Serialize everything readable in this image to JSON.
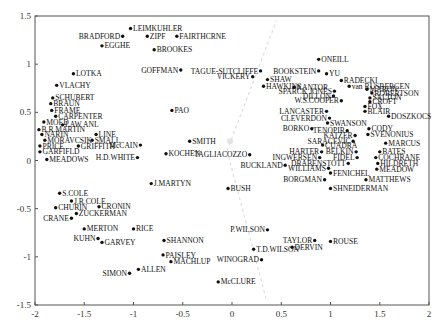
{
  "chart_data": {
    "type": "scatter",
    "title": "",
    "xlabel": "",
    "ylabel": "",
    "xlim": [
      -2,
      2
    ],
    "ylim": [
      -1.5,
      1.5
    ],
    "xticks": [
      -2,
      -1.5,
      -1,
      -0.5,
      0,
      0.5,
      1,
      1.5,
      2
    ],
    "yticks": [
      -1.5,
      -1,
      -0.5,
      0,
      0.5,
      1,
      1.5
    ],
    "grid": false,
    "legend": null,
    "colors": {
      "point": "#111111",
      "axis": "#555555",
      "guide": "#dddddd"
    },
    "points": [
      {
        "label": "LEIMKUHLER",
        "x": -1.03,
        "y": 1.37,
        "side": "right"
      },
      {
        "label": "BRADFORD",
        "x": -1.11,
        "y": 1.29,
        "side": "left"
      },
      {
        "label": "ZIPF",
        "x": -0.86,
        "y": 1.29,
        "side": "right"
      },
      {
        "label": "FAIRTHCRNE",
        "x": -0.56,
        "y": 1.29,
        "side": "right"
      },
      {
        "label": "EGGHE",
        "x": -1.32,
        "y": 1.19,
        "side": "right"
      },
      {
        "label": "BROOKES",
        "x": -0.79,
        "y": 1.15,
        "side": "right"
      },
      {
        "label": "LOTKA",
        "x": -1.61,
        "y": 0.9,
        "side": "right"
      },
      {
        "label": "GOFFMAN",
        "x": -0.52,
        "y": 0.94,
        "side": "left"
      },
      {
        "label": "TAGUE-SUTCLIFFE",
        "x": 0.29,
        "y": 0.93,
        "side": "left"
      },
      {
        "label": "VICKERY",
        "x": 0.21,
        "y": 0.87,
        "side": "left"
      },
      {
        "label": "BOOKSTEIN",
        "x": 0.88,
        "y": 0.93,
        "side": "left"
      },
      {
        "label": "ONEILL",
        "x": 0.88,
        "y": 1.05,
        "side": "right"
      },
      {
        "label": "YU",
        "x": 0.96,
        "y": 0.9,
        "side": "right"
      },
      {
        "label": "SHAW",
        "x": 0.36,
        "y": 0.84,
        "side": "right"
      },
      {
        "label": "HAWKINS",
        "x": 0.32,
        "y": 0.77,
        "side": "right"
      },
      {
        "label": "RADECKI",
        "x": 1.11,
        "y": 0.83,
        "side": "right"
      },
      {
        "label": "KANTOR",
        "x": 0.63,
        "y": 0.76,
        "side": "right"
      },
      {
        "label": "van RUSBERGEN",
        "x": 1.19,
        "y": 0.77,
        "side": "right"
      },
      {
        "label": "MARON",
        "x": 1.37,
        "y": 0.74,
        "side": "right"
      },
      {
        "label": "SPARCK JONES",
        "x": 1.04,
        "y": 0.72,
        "side": "left"
      },
      {
        "label": "ROBERTSON",
        "x": 1.42,
        "y": 0.7,
        "side": "right"
      },
      {
        "label": "DILLON",
        "x": 1.03,
        "y": 0.67,
        "side": "left"
      },
      {
        "label": "SALTON",
        "x": 1.4,
        "y": 0.65,
        "side": "right"
      },
      {
        "label": "W.S.COOPER",
        "x": 1.11,
        "y": 0.62,
        "side": "left"
      },
      {
        "label": "CROFT",
        "x": 1.4,
        "y": 0.61,
        "side": "right"
      },
      {
        "label": "FOX",
        "x": 1.35,
        "y": 0.56,
        "side": "right"
      },
      {
        "label": "BLAIR",
        "x": 1.35,
        "y": 0.51,
        "side": "right"
      },
      {
        "label": "LANCASTER",
        "x": 0.96,
        "y": 0.51,
        "side": "left"
      },
      {
        "label": "DOSZKOCS",
        "x": 1.59,
        "y": 0.46,
        "side": "right"
      },
      {
        "label": "CLEVERDON",
        "x": 0.99,
        "y": 0.44,
        "side": "left"
      },
      {
        "label": "VLACHY",
        "x": -1.78,
        "y": 0.78,
        "side": "right"
      },
      {
        "label": "SCHUBERT",
        "x": -1.82,
        "y": 0.65,
        "side": "right"
      },
      {
        "label": "BRAUN",
        "x": -1.84,
        "y": 0.59,
        "side": "right"
      },
      {
        "label": "FRAME",
        "x": -1.83,
        "y": 0.52,
        "side": "right"
      },
      {
        "label": "CARPENTER",
        "x": -1.79,
        "y": 0.46,
        "side": "right"
      },
      {
        "label": "MOED",
        "x": -1.91,
        "y": 0.4,
        "side": "right"
      },
      {
        "label": "LAW ANL",
        "x": -1.72,
        "y": 0.37,
        "side": "right"
      },
      {
        "label": "B.R.MARTIN",
        "x": -1.96,
        "y": 0.32,
        "side": "right"
      },
      {
        "label": "NARIN",
        "x": -1.93,
        "y": 0.27,
        "side": "right"
      },
      {
        "label": "MORAVCSIK",
        "x": -1.9,
        "y": 0.21,
        "side": "right"
      },
      {
        "label": "PRICE",
        "x": -1.95,
        "y": 0.15,
        "side": "right"
      },
      {
        "label": "GARFIFLD",
        "x": -1.95,
        "y": 0.09,
        "side": "right"
      },
      {
        "label": "MEADOWS",
        "x": -1.88,
        "y": 0.01,
        "side": "right"
      },
      {
        "label": "GRIFFITH",
        "x": -1.56,
        "y": 0.15,
        "side": "right"
      },
      {
        "label": "LINE",
        "x": -1.38,
        "y": 0.27,
        "side": "right"
      },
      {
        "label": "SMALL",
        "x": -1.42,
        "y": 0.21,
        "side": "right"
      },
      {
        "label": "PAO",
        "x": -0.61,
        "y": 0.52,
        "side": "right"
      },
      {
        "label": "McCAIN",
        "x": -0.93,
        "y": 0.16,
        "side": "left"
      },
      {
        "label": "H.D.WHITE",
        "x": -0.96,
        "y": 0.03,
        "side": "left"
      },
      {
        "label": "SMITH",
        "x": -0.43,
        "y": 0.2,
        "side": "right"
      },
      {
        "label": "KOCHEN",
        "x": -0.67,
        "y": 0.07,
        "side": "right"
      },
      {
        "label": "TAGLIACOZZO",
        "x": 0.18,
        "y": 0.06,
        "side": "left"
      },
      {
        "label": "BUCKLAND",
        "x": 0.54,
        "y": -0.05,
        "side": "left"
      },
      {
        "label": "SWANSON",
        "x": 0.97,
        "y": 0.39,
        "side": "right"
      },
      {
        "label": "BORKO",
        "x": 0.81,
        "y": 0.33,
        "side": "left"
      },
      {
        "label": "TENOPIR",
        "x": 1.17,
        "y": 0.31,
        "side": "left"
      },
      {
        "label": "CODY",
        "x": 1.39,
        "y": 0.33,
        "side": "right"
      },
      {
        "label": "KATZER",
        "x": 1.25,
        "y": 0.26,
        "side": "left"
      },
      {
        "label": "SVENONIUS",
        "x": 1.38,
        "y": 0.27,
        "side": "right"
      },
      {
        "label": "SARACEVIC",
        "x": 1.23,
        "y": 0.2,
        "side": "left"
      },
      {
        "label": "CUADRA",
        "x": 0.92,
        "y": 0.16,
        "side": "right"
      },
      {
        "label": "MARCUS",
        "x": 1.56,
        "y": 0.18,
        "side": "right"
      },
      {
        "label": "HARTER",
        "x": 0.91,
        "y": 0.09,
        "side": "left"
      },
      {
        "label": "BELKIN",
        "x": 1.26,
        "y": 0.09,
        "side": "left"
      },
      {
        "label": "BATES",
        "x": 1.5,
        "y": 0.09,
        "side": "right"
      },
      {
        "label": "INGWERSEN",
        "x": 0.89,
        "y": 0.03,
        "side": "left"
      },
      {
        "label": "FIDEL",
        "x": 1.27,
        "y": 0.03,
        "side": "left"
      },
      {
        "label": "COCHRANE",
        "x": 1.46,
        "y": 0.03,
        "side": "right"
      },
      {
        "label": "DRABENSTOTT",
        "x": 1.18,
        "y": -0.03,
        "side": "left"
      },
      {
        "label": "HILDRETH",
        "x": 1.48,
        "y": -0.03,
        "side": "right"
      },
      {
        "label": "WILLIAMS",
        "x": 0.98,
        "y": -0.08,
        "side": "left"
      },
      {
        "label": "MEADOW",
        "x": 1.47,
        "y": -0.09,
        "side": "right"
      },
      {
        "label": "FENICHEL",
        "x": 1.0,
        "y": -0.13,
        "side": "right"
      },
      {
        "label": "BORGMAN",
        "x": 0.94,
        "y": -0.2,
        "side": "left"
      },
      {
        "label": "MATTHEWS",
        "x": 1.36,
        "y": -0.2,
        "side": "right"
      },
      {
        "label": "SHNEIDERMAN",
        "x": 1.0,
        "y": -0.29,
        "side": "right"
      },
      {
        "label": "S.COLE",
        "x": -1.75,
        "y": -0.34,
        "side": "right"
      },
      {
        "label": "J.R.COLE",
        "x": -1.63,
        "y": -0.42,
        "side": "right"
      },
      {
        "label": "CRONIN",
        "x": -1.35,
        "y": -0.48,
        "side": "right"
      },
      {
        "label": "CHURIN",
        "x": -1.79,
        "y": -0.49,
        "side": "right"
      },
      {
        "label": "ZUCKERMAN",
        "x": -1.58,
        "y": -0.55,
        "side": "right"
      },
      {
        "label": "CRANE",
        "x": -1.63,
        "y": -0.6,
        "side": "left"
      },
      {
        "label": "J.MARTYN",
        "x": -0.82,
        "y": -0.24,
        "side": "right"
      },
      {
        "label": "BUSH",
        "x": -0.04,
        "y": -0.29,
        "side": "right"
      },
      {
        "label": "RICE",
        "x": -1.0,
        "y": -0.71,
        "side": "right"
      },
      {
        "label": "MERTON",
        "x": -1.5,
        "y": -0.71,
        "side": "right"
      },
      {
        "label": "KUHN",
        "x": -1.36,
        "y": -0.81,
        "side": "left"
      },
      {
        "label": "GARVEY",
        "x": -1.32,
        "y": -0.85,
        "side": "right"
      },
      {
        "label": "SHANNON",
        "x": -0.69,
        "y": -0.83,
        "side": "right"
      },
      {
        "label": "P.WILSON",
        "x": 0.36,
        "y": -0.72,
        "side": "left"
      },
      {
        "label": "TAYLOR",
        "x": 0.84,
        "y": -0.83,
        "side": "left"
      },
      {
        "label": "ROUSE",
        "x": 1.0,
        "y": -0.84,
        "side": "right"
      },
      {
        "label": "DERVIN",
        "x": 0.61,
        "y": -0.9,
        "side": "right"
      },
      {
        "label": "T.D.WILSON",
        "x": 0.22,
        "y": -0.92,
        "side": "right"
      },
      {
        "label": "PAISLEY",
        "x": -0.7,
        "y": -0.98,
        "side": "right"
      },
      {
        "label": "MACHLUP",
        "x": -0.62,
        "y": -1.05,
        "side": "right"
      },
      {
        "label": "WINOGRAD",
        "x": 0.3,
        "y": -1.03,
        "side": "left"
      },
      {
        "label": "ALLEN",
        "x": -0.95,
        "y": -1.13,
        "side": "right"
      },
      {
        "label": "SIMON",
        "x": -1.04,
        "y": -1.17,
        "side": "left"
      },
      {
        "label": "McCLURE",
        "x": -0.14,
        "y": -1.26,
        "side": "right"
      }
    ]
  }
}
